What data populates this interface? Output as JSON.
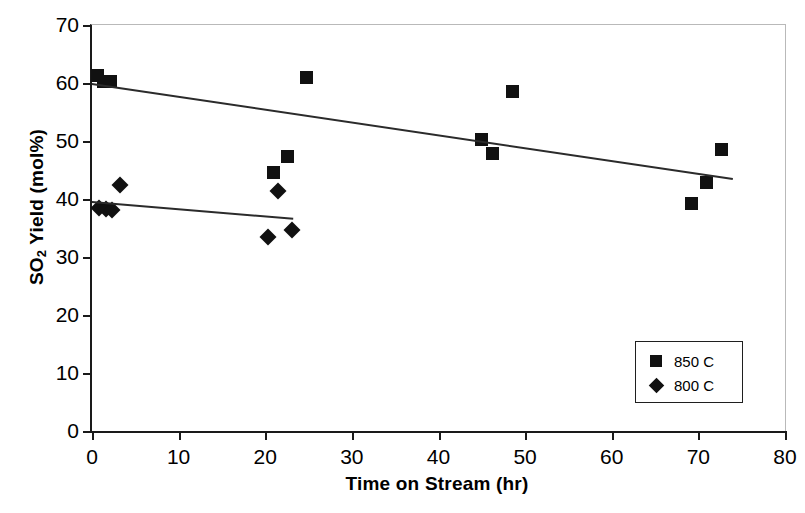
{
  "chart_data": {
    "type": "scatter",
    "title": "",
    "xlabel": "Time on Stream (hr)",
    "ylabel_html": "SO2 Yield (mol%)",
    "ylabel_main": "SO",
    "ylabel_sub": "2",
    "ylabel_rest": " Yield (mol%)",
    "xlim": [
      0,
      80
    ],
    "ylim": [
      0,
      70
    ],
    "xticks": [
      0,
      10,
      20,
      30,
      40,
      50,
      60,
      70,
      80
    ],
    "yticks": [
      0,
      10,
      20,
      30,
      40,
      50,
      60,
      70
    ],
    "grid": false,
    "legend_position": "lower-right",
    "marker_color": "#111111",
    "axis_color": "#1a1a1a",
    "frame_color": "#b9b9b9",
    "series": [
      {
        "name": "850 C",
        "marker": "square",
        "points": [
          [
            0.6,
            61.3
          ],
          [
            1.3,
            60.3
          ],
          [
            2.1,
            60.2
          ],
          [
            20.9,
            44.6
          ],
          [
            22.6,
            47.4
          ],
          [
            24.8,
            60.9
          ],
          [
            45.0,
            50.3
          ],
          [
            46.2,
            47.9
          ],
          [
            48.6,
            58.6
          ],
          [
            69.2,
            39.2
          ],
          [
            70.9,
            42.8
          ],
          [
            72.7,
            48.5
          ]
        ],
        "trendline": [
          [
            0.0,
            60.0
          ],
          [
            74.0,
            43.6
          ]
        ]
      },
      {
        "name": "800 C",
        "marker": "diamond",
        "points": [
          [
            0.8,
            38.4
          ],
          [
            1.6,
            38.2
          ],
          [
            2.3,
            38.1
          ],
          [
            3.2,
            42.4
          ],
          [
            20.3,
            33.4
          ],
          [
            21.5,
            41.3
          ],
          [
            23.1,
            34.6
          ]
        ],
        "trendline": [
          [
            0.0,
            39.7
          ],
          [
            23.2,
            36.8
          ]
        ]
      }
    ]
  },
  "legend": {
    "entries": [
      {
        "label": "850 C",
        "marker": "square-icon"
      },
      {
        "label": "800 C",
        "marker": "diamond-icon"
      }
    ]
  }
}
